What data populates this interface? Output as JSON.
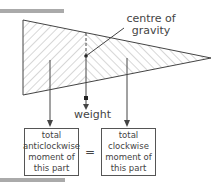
{
  "diagram": {
    "labels": {
      "centre_of_gravity": "centre of gravity",
      "weight": "weight",
      "equals": "="
    },
    "boxes": [
      {
        "lines": [
          "total",
          "anticlockwise",
          "moment of",
          "this part"
        ]
      },
      {
        "lines": [
          "total",
          "clockwise",
          "moment of",
          "this part"
        ]
      }
    ],
    "colors": {
      "line": "#444444",
      "hatch": "#9a9a9a",
      "bar": "#aaaaaa"
    }
  }
}
